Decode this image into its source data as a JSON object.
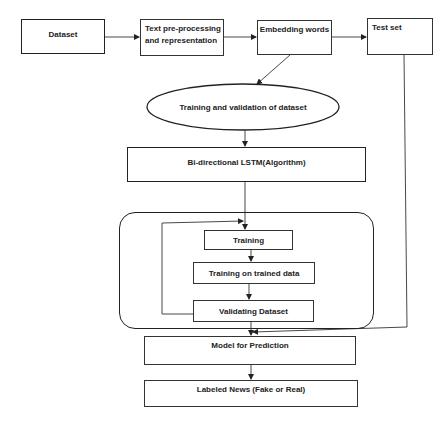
{
  "diagram": {
    "type": "flowchart",
    "nodes": {
      "dataset": "Dataset",
      "preprocessing": "Text pre-processing and representation",
      "preprocessing_line1": "Text pre-processing",
      "preprocessing_line2": "and representation",
      "embedding": "Embedding words",
      "test_set": "Test set",
      "train_val": "Training and validation of dataset",
      "bilstm": "Bi-directional LSTM(Algorithm)",
      "training": "Training",
      "training_trained": "Training on trained data",
      "validating": "Validating Dataset",
      "model": "Model for Prediction",
      "labeled": "Labeled News (Fake or Real)"
    },
    "edges": [
      {
        "from": "Dataset",
        "to": "Text pre-processing and representation"
      },
      {
        "from": "Text pre-processing and representation",
        "to": "Embedding words"
      },
      {
        "from": "Embedding words",
        "to": "Test set"
      },
      {
        "from": "Embedding words",
        "to": "Training and validation of dataset"
      },
      {
        "from": "Training and validation of dataset",
        "to": "Bi-directional LSTM(Algorithm)"
      },
      {
        "from": "Bi-directional LSTM(Algorithm)",
        "to": "Training"
      },
      {
        "from": "Training",
        "to": "Training on trained data"
      },
      {
        "from": "Training on trained data",
        "to": "Validating Dataset"
      },
      {
        "from": "Validating Dataset",
        "to": "Training",
        "kind": "feedback loop"
      },
      {
        "from": "Validating Dataset",
        "to": "Model for Prediction"
      },
      {
        "from": "Test set",
        "to": "Model for Prediction"
      },
      {
        "from": "Model for Prediction",
        "to": "Labeled News (Fake or Real)"
      }
    ],
    "colors": {
      "line": "#222222",
      "background": "#ffffff"
    }
  }
}
